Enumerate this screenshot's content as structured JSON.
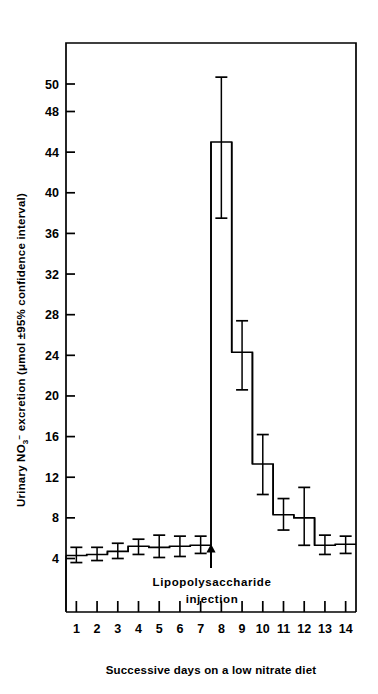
{
  "chart_data": {
    "type": "bar",
    "title": "",
    "xlabel": "Successive days on a low nitrate diet",
    "ylabel": "Urinary NO₃⁻ excretion (μmol ±95% confidence interval)",
    "ylabel_parts": {
      "prefix": "Urinary NO",
      "sub": "3",
      "sup": "−",
      "suffix": " excretion (",
      "mu": "μ",
      "unit": "mol ",
      "pm": "±",
      "ci": "95% confidence interval)"
    },
    "categories": [
      "1",
      "2",
      "3",
      "4",
      "5",
      "6",
      "7",
      "8",
      "9",
      "10",
      "11",
      "12",
      "13",
      "14"
    ],
    "xtick_labels": [
      "1",
      "2",
      "3",
      "4",
      "5",
      "6",
      "7",
      "8",
      "9",
      "10",
      "11",
      "12",
      "13",
      "14"
    ],
    "ytick_labels": [
      "4",
      "8",
      "12",
      "16",
      "20",
      "24",
      "28",
      "32",
      "36",
      "40",
      "44",
      "48",
      "50"
    ],
    "ytick_values": [
      4,
      8,
      12,
      16,
      20,
      24,
      28,
      32,
      36,
      40,
      44,
      48,
      50
    ],
    "ylim": [
      2.6,
      53.5
    ],
    "xlim": [
      0.5,
      14.5
    ],
    "grid": false,
    "legend": null,
    "values": [
      4.3,
      4.4,
      4.7,
      5.2,
      5.1,
      5.2,
      5.3,
      45.0,
      24.3,
      13.3,
      8.3,
      8.0,
      5.3,
      5.4
    ],
    "ci_lower": [
      3.6,
      3.8,
      4.0,
      4.4,
      4.1,
      4.2,
      4.5,
      37.5,
      20.6,
      10.3,
      6.8,
      5.3,
      4.4,
      4.5
    ],
    "ci_upper": [
      5.1,
      5.1,
      5.5,
      5.9,
      6.3,
      6.2,
      6.2,
      50.5,
      27.4,
      16.2,
      9.9,
      11.0,
      6.3,
      6.2
    ],
    "annotations": [
      {
        "name": "lipopolysaccharide-injection",
        "line1": "Lipopolysaccharide",
        "line2": "injection",
        "arrow": "up-arrow",
        "at_x": 7.5
      }
    ]
  }
}
